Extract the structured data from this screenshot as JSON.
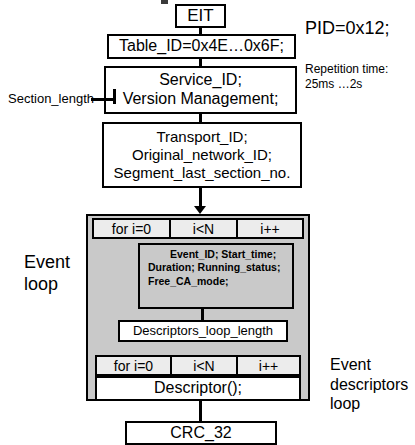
{
  "diagram": {
    "title_text": "EIT section structure",
    "nodes": {
      "eit": "EIT",
      "table_id": "Table_ID=0x4E…0x6F;",
      "service": [
        "Service_ID;",
        "Version Management;"
      ],
      "transport": [
        "Transport_ID;",
        "Original_network_ID;",
        "Segment_last_section_no."
      ],
      "event_fields": [
        "Event_ID;",
        "Start_time;",
        "Duration;",
        "Running_status;",
        "Free_CA_mode;"
      ],
      "descriptors_loop_length": "Descriptors_loop_length",
      "descriptor": "Descriptor();",
      "crc": "CRC_32"
    },
    "for_loops": {
      "event": {
        "init": "for i=0",
        "cond": "i<N",
        "incr": "i++"
      },
      "descriptor": {
        "init": "for i=0",
        "cond": "i<N",
        "incr": "i++"
      }
    },
    "annotations": {
      "pid": "PID=0x12;",
      "repetition_time": [
        "Repetition time:",
        "25ms …2s"
      ],
      "section_length": "Section_length",
      "event_loop": [
        "Event",
        "loop"
      ],
      "event_descriptors_loop": [
        "Event",
        "descriptors",
        "loop"
      ]
    },
    "colors": {
      "line": "#000000",
      "loop_fill": "#c9c9c9",
      "box_fill": "#ffffff",
      "for_row_fill": "#ececec"
    }
  }
}
